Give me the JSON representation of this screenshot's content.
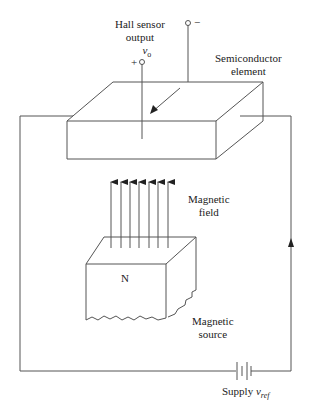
{
  "labels": {
    "hall_output_line1": "Hall sensor",
    "hall_output_line2": "output",
    "hall_output_symbol": "v",
    "hall_output_subscript": "o",
    "plus": "+",
    "minus": "−",
    "semiconductor_line1": "Semiconductor",
    "semiconductor_line2": "element",
    "field_line1": "Magnetic",
    "field_line2": "field",
    "pole": "N",
    "source_line1": "Magnetic",
    "source_line2": "source",
    "supply": "Supply",
    "supply_symbol": "v",
    "supply_subscript": "ref"
  },
  "colors": {
    "line": "#444444",
    "text": "#222222"
  }
}
